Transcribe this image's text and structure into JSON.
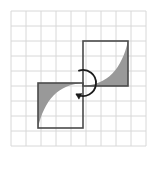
{
  "figure": {
    "title": "Rotation of a shaded curved quadrilateral about a point",
    "caption": "",
    "background_color": "#ffffff",
    "width": 163,
    "height": 170
  },
  "grid": {
    "name": "graph-paper-grid",
    "columns": 9,
    "rows": 9,
    "cell_size": 15,
    "origin_x": 11,
    "origin_y": 11,
    "line_color": "#d8d8d8",
    "line_width": 1,
    "visible": true
  },
  "shapes": [
    {
      "id": "upper-right-square",
      "label": "Image square (after rotation)",
      "type": "square",
      "x": 83,
      "y": 41,
      "size": 45,
      "stroke_color": "#4a4a4a",
      "stroke_width": 1.6,
      "fill": "none",
      "shaded_region": {
        "label": "shaded concave region",
        "fill_color": "#999999",
        "description": "Region between the right and bottom edges and a concave curve from bottom-left corner to top-right corner"
      }
    },
    {
      "id": "lower-left-square",
      "label": "Pre-image square (before rotation)",
      "type": "square",
      "x": 38,
      "y": 83,
      "size": 45,
      "stroke_color": "#4a4a4a",
      "stroke_width": 1.6,
      "fill": "none",
      "shaded_region": {
        "label": "shaded concave region",
        "fill_color": "#999999",
        "description": "Region between the left and top edges and a concave curve from top-right corner to bottom-left corner"
      }
    }
  ],
  "rotation_arrow": {
    "name": "rotation-arrow",
    "label": "180 degree rotation arrow",
    "center_x": 83,
    "center_y": 83,
    "radius": 13,
    "stroke_color": "#1a1a1a",
    "stroke_width": 1.8,
    "direction": "clockwise",
    "angle_degrees": 180,
    "arrowhead_color": "#1a1a1a"
  },
  "center_point": {
    "name": "center-of-rotation",
    "x": 83,
    "y": 83,
    "label": ""
  },
  "labels": []
}
